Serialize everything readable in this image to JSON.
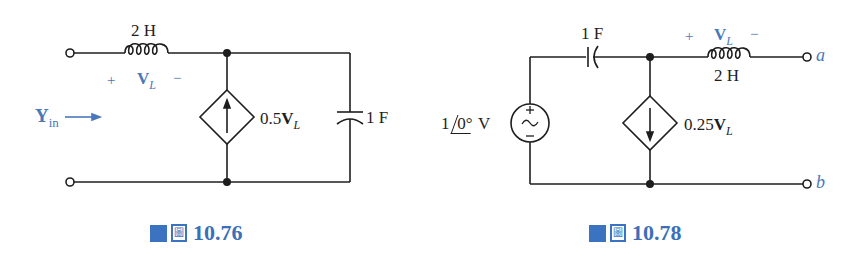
{
  "figures": [
    {
      "id": "fig-10-76",
      "caption": {
        "prefix_glyph": "圖",
        "number": "10.76"
      },
      "inductor": {
        "value": "2 H"
      },
      "inductor_voltage": {
        "plus": "+",
        "symbol": "V",
        "subscript": "L",
        "minus": "−"
      },
      "input_admittance": {
        "symbol": "Y",
        "subscript": "in",
        "arrow": "⟶"
      },
      "dependent_source": {
        "type": "current",
        "direction": "up",
        "label_coef": "0.5",
        "label_var": "V",
        "label_sub": "L"
      },
      "capacitor": {
        "value": "1 F"
      }
    },
    {
      "id": "fig-10-78",
      "caption": {
        "prefix_glyph": "圖",
        "number": "10.78"
      },
      "capacitor": {
        "value": "1 F"
      },
      "inductor": {
        "value": "2 H"
      },
      "inductor_voltage": {
        "plus": "+",
        "symbol": "V",
        "subscript": "L",
        "minus": "−"
      },
      "voltage_source": {
        "magnitude": "1",
        "angle": "0°",
        "unit": "V",
        "plus": "+",
        "minus": "−",
        "ac": "~"
      },
      "dependent_source": {
        "type": "current",
        "direction": "down",
        "label_coef": "0.25",
        "label_var": "V",
        "label_sub": "L"
      },
      "terminals": {
        "a": "a",
        "b": "b"
      }
    }
  ],
  "colors": {
    "accent_blue": "#3b73c0",
    "label_blue": "#4a78b8",
    "wire": "#1e1e1e"
  }
}
